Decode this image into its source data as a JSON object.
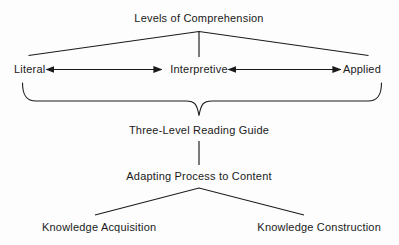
{
  "diagram": {
    "title": "Levels of Comprehension",
    "type": "hierarchy-flow-diagram",
    "stroke_color": "#1a1a1a",
    "text_color": "#1a1a1a",
    "background_color": "#fdfdfd",
    "nodes": {
      "root": "Levels of Comprehension",
      "level_literal": "Literal",
      "level_interpretive": "Interpretive",
      "level_applied": "Applied",
      "guide": "Three-Level Reading Guide",
      "adapting": "Adapting Process to Content",
      "outcome_left": "Knowledge Acquisition",
      "outcome_right": "Knowledge Construction"
    },
    "connectors": [
      {
        "name": "root-fan-to-levels",
        "kind": "inverted-v",
        "from": "Levels of Comprehension",
        "to": [
          "Literal",
          "Applied"
        ]
      },
      {
        "name": "root-stem-to-interpretive",
        "kind": "vertical-line",
        "from": "Levels of Comprehension",
        "to": "Interpretive"
      },
      {
        "name": "literal-interpretive-arrow",
        "kind": "double-headed-arrow",
        "from": "Literal",
        "to": "Interpretive"
      },
      {
        "name": "applied-interpretive-arrow",
        "kind": "double-headed-arrow",
        "from": "Applied",
        "to": "Interpretive"
      },
      {
        "name": "levels-brace-to-guide",
        "kind": "curly-brace",
        "from": [
          "Literal",
          "Interpretive",
          "Applied"
        ],
        "to": "Three-Level Reading Guide"
      },
      {
        "name": "guide-to-adapting",
        "kind": "vertical-line",
        "from": "Three-Level Reading Guide",
        "to": "Adapting Process to Content"
      },
      {
        "name": "adapting-fan-to-outcomes",
        "kind": "inverted-v",
        "from": "Adapting Process to Content",
        "to": [
          "Knowledge Acquisition",
          "Knowledge Construction"
        ]
      }
    ]
  }
}
